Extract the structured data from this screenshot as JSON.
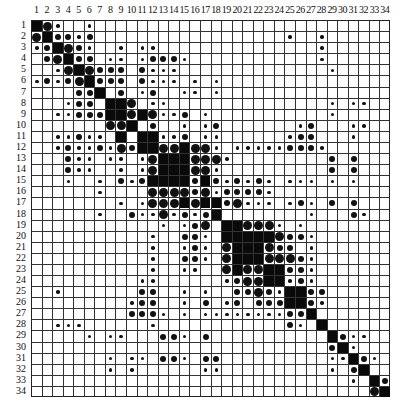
{
  "chart_data": {
    "type": "heatmap",
    "title": "",
    "n": 34,
    "row_labels": [
      "1",
      "2",
      "3",
      "4",
      "5",
      "6",
      "7",
      "8",
      "9",
      "10",
      "11",
      "12",
      "13",
      "14",
      "15",
      "16",
      "17",
      "18",
      "19",
      "20",
      "21",
      "22",
      "23",
      "24",
      "25",
      "26",
      "27",
      "28",
      "29",
      "30",
      "31",
      "32",
      "33",
      "34"
    ],
    "col_labels": [
      "1",
      "2",
      "3",
      "4",
      "5",
      "6",
      "7",
      "8",
      "9",
      "10",
      "11",
      "12",
      "13",
      "14",
      "15",
      "16",
      "17",
      "18",
      "19",
      "20",
      "21",
      "22",
      "23",
      "24",
      "25",
      "26",
      "27",
      "28",
      "29",
      "30",
      "31",
      "32",
      "33",
      "34"
    ],
    "legend": {
      "F": "filled cell (strongest)",
      "L": "large dot",
      "M": "medium dot",
      "S": "small dot"
    },
    "cells": {
      "1": {
        "1": "F",
        "2": "L",
        "3": "S",
        "6": "S"
      },
      "2": {
        "1": "L",
        "2": "F",
        "3": "M",
        "4": "M",
        "5": "S",
        "6": "M",
        "25": "S",
        "28": "S"
      },
      "3": {
        "1": "S",
        "2": "M",
        "3": "F",
        "4": "L",
        "5": "M",
        "6": "S",
        "9": "S",
        "11": "S",
        "12": "S",
        "28": "S"
      },
      "4": {
        "2": "M",
        "3": "L",
        "4": "F",
        "5": "M",
        "6": "M",
        "8": "S",
        "9": "S",
        "11": "S",
        "12": "M",
        "13": "M",
        "14": "M",
        "15": "S",
        "28": "S"
      },
      "5": {
        "3": "S",
        "4": "L",
        "5": "F",
        "6": "L",
        "7": "M",
        "8": "M",
        "9": "M",
        "11": "M",
        "12": "S",
        "13": "S",
        "14": "S",
        "29": "S"
      },
      "6": {
        "1": "S",
        "2": "M",
        "3": "S",
        "4": "M",
        "5": "L",
        "6": "F",
        "7": "M",
        "8": "M",
        "9": "M",
        "11": "M",
        "12": "S",
        "13": "S",
        "14": "S",
        "16": "S",
        "18": "S"
      },
      "7": {
        "5": "M",
        "6": "M",
        "7": "F",
        "9": "M",
        "11": "S",
        "12": "M",
        "15": "S",
        "16": "S",
        "18": "S"
      },
      "8": {
        "4": "S",
        "5": "M",
        "6": "M",
        "8": "F",
        "9": "F",
        "10": "L",
        "12": "S",
        "13": "S",
        "29": "S",
        "31": "S",
        "32": "S"
      },
      "9": {
        "3": "S",
        "4": "S",
        "5": "M",
        "6": "M",
        "7": "M",
        "8": "F",
        "9": "F",
        "10": "L",
        "11": "F",
        "12": "L",
        "13": "S",
        "14": "S",
        "15": "M",
        "17": "S",
        "29": "S"
      },
      "10": {
        "8": "L",
        "9": "L",
        "10": "F",
        "12": "M",
        "15": "S",
        "17": "S",
        "18": "M",
        "26": "S",
        "27": "M",
        "31": "S",
        "32": "S"
      },
      "11": {
        "3": "S",
        "4": "S",
        "5": "M",
        "6": "S",
        "7": "S",
        "9": "F",
        "11": "F",
        "12": "F",
        "13": "S",
        "14": "S",
        "15": "M",
        "17": "S",
        "18": "S",
        "25": "S",
        "26": "M",
        "27": "M",
        "31": "S"
      },
      "12": {
        "3": "S",
        "4": "M",
        "5": "S",
        "6": "S",
        "7": "M",
        "8": "S",
        "9": "L",
        "10": "M",
        "11": "F",
        "12": "F",
        "13": "L",
        "14": "L",
        "15": "F",
        "16": "L",
        "17": "L",
        "18": "S",
        "20": "S",
        "21": "S",
        "22": "S",
        "23": "S",
        "24": "S",
        "25": "M",
        "26": "M",
        "27": "M",
        "28": "S"
      },
      "13": {
        "4": "M",
        "5": "S",
        "6": "S",
        "8": "S",
        "9": "S",
        "11": "S",
        "12": "L",
        "13": "F",
        "14": "F",
        "15": "F",
        "16": "L",
        "17": "L",
        "18": "L",
        "19": "S",
        "29": "M",
        "31": "M"
      },
      "14": {
        "4": "M",
        "5": "S",
        "6": "S",
        "9": "S",
        "11": "S",
        "12": "L",
        "13": "F",
        "14": "F",
        "15": "F",
        "16": "L",
        "17": "L",
        "18": "S",
        "29": "M",
        "31": "M"
      },
      "15": {
        "4": "S",
        "7": "S",
        "9": "M",
        "10": "S",
        "11": "M",
        "12": "F",
        "13": "F",
        "14": "F",
        "15": "F",
        "16": "M",
        "17": "F",
        "18": "M",
        "19": "S",
        "20": "M",
        "21": "S",
        "22": "M",
        "23": "S",
        "25": "S",
        "26": "S",
        "27": "S",
        "29": "S",
        "31": "S"
      },
      "16": {
        "7": "S",
        "12": "L",
        "13": "L",
        "14": "L",
        "15": "L",
        "16": "M",
        "17": "L",
        "18": "S",
        "19": "M",
        "20": "M",
        "21": "M",
        "22": "M",
        "23": "S"
      },
      "17": {
        "9": "S",
        "11": "S",
        "12": "L",
        "13": "L",
        "14": "L",
        "15": "F",
        "16": "L",
        "17": "F",
        "18": "F",
        "19": "M",
        "20": "L",
        "21": "S",
        "22": "S",
        "23": "S",
        "25": "S",
        "26": "M",
        "27": "S",
        "29": "M",
        "31": "M"
      },
      "18": {
        "7": "S",
        "10": "M",
        "11": "S",
        "12": "S",
        "13": "L",
        "14": "S",
        "15": "M",
        "16": "S",
        "17": "M",
        "18": "F",
        "27": "S",
        "31": "M",
        "32": "S"
      },
      "19": {
        "13": "S",
        "15": "S",
        "16": "M",
        "17": "L",
        "19": "F",
        "20": "F",
        "21": "L",
        "22": "L",
        "23": "L",
        "24": "S",
        "26": "S"
      },
      "20": {
        "12": "S",
        "15": "M",
        "16": "M",
        "17": "S",
        "19": "F",
        "20": "F",
        "21": "F",
        "22": "F",
        "23": "F",
        "24": "L",
        "25": "M",
        "26": "M",
        "27": "S"
      },
      "21": {
        "12": "S",
        "15": "S",
        "16": "M",
        "17": "S",
        "19": "L",
        "20": "F",
        "21": "F",
        "22": "F",
        "23": "L",
        "24": "M",
        "25": "M",
        "27": "S"
      },
      "22": {
        "12": "S",
        "15": "M",
        "16": "M",
        "17": "S",
        "19": "L",
        "20": "F",
        "21": "F",
        "22": "F",
        "23": "L",
        "24": "L",
        "25": "L",
        "26": "M",
        "27": "S"
      },
      "23": {
        "12": "S",
        "15": "S",
        "16": "S",
        "19": "L",
        "20": "F",
        "21": "L",
        "22": "L",
        "23": "F",
        "24": "F",
        "25": "M",
        "26": "M",
        "27": "S"
      },
      "24": {
        "11": "S",
        "12": "S",
        "19": "S",
        "20": "M",
        "21": "L",
        "22": "L",
        "23": "F",
        "24": "F",
        "25": "S",
        "26": "M",
        "27": "S"
      },
      "25": {
        "3": "S",
        "11": "M",
        "12": "M",
        "15": "S",
        "17": "S",
        "20": "M",
        "21": "M",
        "22": "L",
        "23": "M",
        "24": "S",
        "25": "F",
        "26": "F",
        "27": "M",
        "28": "M"
      },
      "26": {
        "10": "S",
        "11": "M",
        "12": "M",
        "15": "S",
        "17": "M",
        "19": "S",
        "20": "M",
        "22": "M",
        "23": "M",
        "24": "M",
        "25": "F",
        "26": "F",
        "27": "M",
        "28": "S"
      },
      "27": {
        "10": "M",
        "11": "M",
        "12": "M",
        "13": "S",
        "15": "S",
        "17": "S",
        "18": "S",
        "19": "S",
        "20": "S",
        "21": "S",
        "22": "S",
        "23": "S",
        "24": "S",
        "25": "M",
        "26": "M",
        "27": "F"
      },
      "28": {
        "3": "S",
        "4": "S",
        "5": "S",
        "12": "S",
        "25": "M",
        "26": "S",
        "28": "F"
      },
      "29": {
        "6": "S",
        "8": "S",
        "9": "S",
        "13": "M",
        "14": "M",
        "15": "S",
        "17": "M",
        "29": "F",
        "30": "M",
        "31": "S",
        "32": "S"
      },
      "30": {
        "29": "M",
        "30": "F",
        "31": "S"
      },
      "31": {
        "8": "S",
        "10": "S",
        "11": "S",
        "13": "M",
        "14": "M",
        "15": "S",
        "17": "M",
        "18": "M",
        "29": "S",
        "30": "S",
        "31": "F",
        "32": "M",
        "33": "S"
      },
      "32": {
        "8": "S",
        "10": "S",
        "17": "S",
        "18": "S",
        "29": "S",
        "31": "M",
        "32": "F"
      },
      "33": {
        "31": "S",
        "33": "F",
        "34": "M"
      },
      "34": {
        "33": "L",
        "34": "F"
      }
    }
  }
}
